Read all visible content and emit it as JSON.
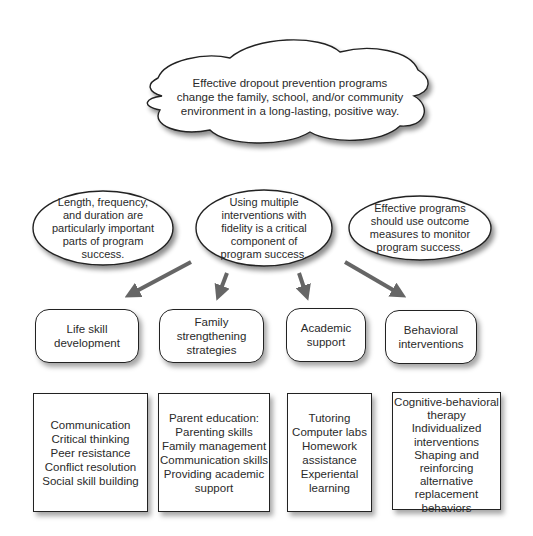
{
  "diagram": {
    "cloud": {
      "lines": [
        "Effective dropout prevention programs",
        "change the family, school, and/or community",
        "environment in a long-lasting, positive way."
      ]
    },
    "ovals": [
      {
        "id": "length-frequency",
        "lines": [
          "Length, frequency,",
          "and duration are",
          "particularly important",
          "parts of program",
          "success."
        ]
      },
      {
        "id": "multiple-interventions",
        "lines": [
          "Using multiple",
          "interventions with",
          "fidelity is a critical",
          "component of",
          "program success."
        ]
      },
      {
        "id": "outcome-measures",
        "lines": [
          "Effective programs",
          "should use outcome",
          "measures to monitor",
          "program success."
        ]
      }
    ],
    "categories": [
      {
        "id": "life-skill",
        "lines": [
          "Life skill",
          "development"
        ]
      },
      {
        "id": "family",
        "lines": [
          "Family",
          "strengthening",
          "strategies"
        ]
      },
      {
        "id": "academic",
        "lines": [
          "Academic",
          "support"
        ]
      },
      {
        "id": "behavioral",
        "lines": [
          "Behavioral",
          "interventions"
        ]
      }
    ],
    "lists": [
      {
        "id": "life-skill-list",
        "items": [
          "Communication",
          "Critical thinking",
          "Peer resistance",
          "Conflict resolution",
          "Social skill building"
        ]
      },
      {
        "id": "family-list",
        "items": [
          "Parent education:",
          "Parenting skills",
          "Family management",
          "Communication skills",
          "Providing academic",
          "support"
        ]
      },
      {
        "id": "academic-list",
        "items": [
          "Tutoring",
          "Computer labs",
          "Homework",
          "assistance",
          "Experiental",
          "learning"
        ]
      },
      {
        "id": "behavioral-list",
        "items": [
          "Cognitive-behavioral",
          "therapy",
          "Individualized",
          "interventions",
          "Shaping and",
          "reinforcing",
          "alternative",
          "replacement",
          "behaviors"
        ]
      }
    ],
    "colors": {
      "outline": "#222222",
      "arrow": "#666666",
      "text": "#2a2a2a",
      "background": "#ffffff"
    }
  }
}
